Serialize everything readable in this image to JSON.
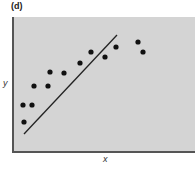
{
  "panel": {
    "label": "(d)"
  },
  "chart_data": {
    "type": "scatter",
    "title": "(d)",
    "xlabel": "x",
    "ylabel": "y",
    "grid": false,
    "legend": null,
    "background_color": "#d4d4d4",
    "point_color": "#111111",
    "points_px": [
      {
        "x": 23,
        "y": 105
      },
      {
        "x": 32,
        "y": 105
      },
      {
        "x": 24,
        "y": 122
      },
      {
        "x": 34,
        "y": 86
      },
      {
        "x": 48,
        "y": 86
      },
      {
        "x": 50,
        "y": 72
      },
      {
        "x": 64,
        "y": 73
      },
      {
        "x": 80,
        "y": 63
      },
      {
        "x": 91,
        "y": 52
      },
      {
        "x": 105,
        "y": 57
      },
      {
        "x": 116,
        "y": 47
      },
      {
        "x": 138,
        "y": 42
      },
      {
        "x": 143,
        "y": 52
      }
    ],
    "points_relative": [
      {
        "x": 0.05,
        "y": 0.35
      },
      {
        "x": 0.1,
        "y": 0.35
      },
      {
        "x": 0.06,
        "y": 0.22
      },
      {
        "x": 0.12,
        "y": 0.49
      },
      {
        "x": 0.19,
        "y": 0.49
      },
      {
        "x": 0.2,
        "y": 0.59
      },
      {
        "x": 0.28,
        "y": 0.58
      },
      {
        "x": 0.37,
        "y": 0.66
      },
      {
        "x": 0.43,
        "y": 0.74
      },
      {
        "x": 0.51,
        "y": 0.7
      },
      {
        "x": 0.57,
        "y": 0.78
      },
      {
        "x": 0.69,
        "y": 0.81
      },
      {
        "x": 0.71,
        "y": 0.74
      }
    ],
    "fit_line_px": {
      "x1": 24,
      "y1": 134,
      "x2": 117,
      "y2": 35
    },
    "annotations": [
      "fitted line lies below most data points (poor fit)"
    ]
  }
}
